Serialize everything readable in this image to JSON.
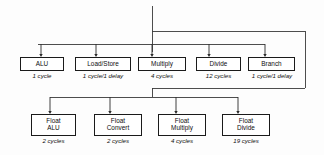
{
  "diagram": {
    "line_color": "#3a3a3a",
    "box_border_color": "#1a1a1a",
    "background_color": "#fdfdfd",
    "integer_units": [
      {
        "label": "ALU",
        "caption": "1 cycle",
        "box_x": 20,
        "box_w": 44,
        "arrow_x": 41,
        "caption_x": 20,
        "caption_w": 44
      },
      {
        "label": "Load/Store",
        "caption": "1 cycle/1 delay",
        "box_x": 75,
        "box_w": 56,
        "arrow_x": 96,
        "caption_x": 71,
        "caption_w": 64
      },
      {
        "label": "Multiply",
        "caption": "4 cycles",
        "box_x": 138,
        "box_w": 48,
        "arrow_x": 152,
        "caption_x": 138,
        "caption_w": 48
      },
      {
        "label": "Divide",
        "caption": "12 cycles",
        "box_x": 196,
        "box_w": 45,
        "arrow_x": 209,
        "caption_x": 194,
        "caption_w": 49
      },
      {
        "label": "Branch",
        "caption": "1 cycle/1 delay",
        "box_x": 248,
        "box_w": 47,
        "arrow_x": 265,
        "caption_x": 240,
        "caption_w": 64
      }
    ],
    "float_units": [
      {
        "label": "Float\nALU",
        "caption": "2 cycles",
        "box_x": 31,
        "box_w": 45,
        "arrow_x": 50,
        "caption_x": 29,
        "caption_w": 49
      },
      {
        "label": "Float\nConvert",
        "caption": "2 cycles",
        "box_x": 94,
        "box_w": 48,
        "arrow_x": 110,
        "caption_x": 94,
        "caption_w": 48
      },
      {
        "label": "Float\nMultiply",
        "caption": "4 cycles",
        "box_x": 158,
        "box_w": 48,
        "arrow_x": 176,
        "caption_x": 158,
        "caption_w": 48
      },
      {
        "label": "Float\nDivide",
        "caption": "19 cycles",
        "box_x": 222,
        "box_w": 48,
        "arrow_x": 238,
        "caption_x": 220,
        "caption_w": 52
      }
    ],
    "wires": {
      "trunk_x": 152,
      "trunk_top_y": 6,
      "upper_bus_y": 31,
      "upper_bus_right_x": 305,
      "integer_bus_y": 44,
      "integer_bus_left_x": 38,
      "integer_bus_right_x": 265,
      "right_drop_bottom_y": 88,
      "float_feed_y": 88,
      "float_bus_y": 97,
      "float_bus_left_x": 50,
      "float_bus_right_x": 238,
      "integer_box_top_y": 57,
      "float_box_top_y": 114
    }
  }
}
